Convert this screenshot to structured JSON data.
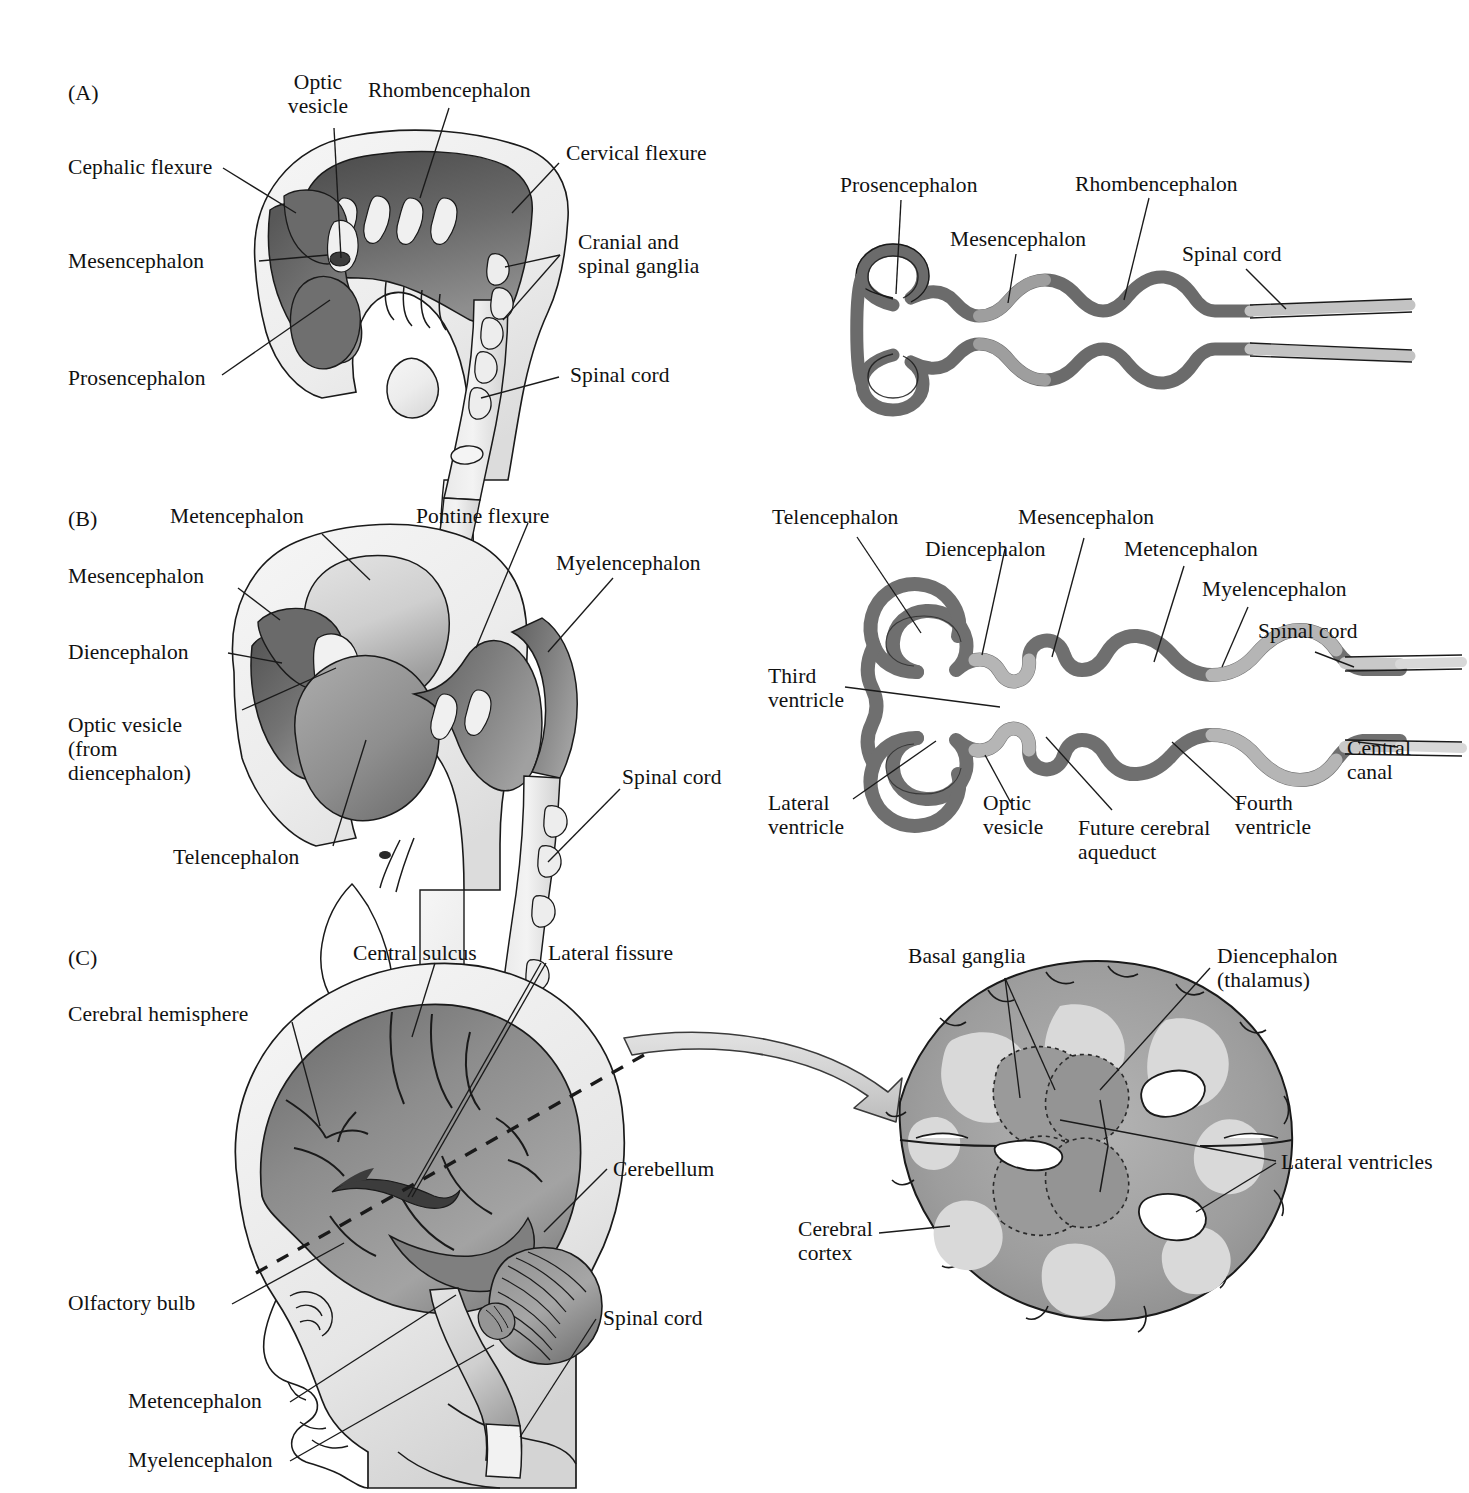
{
  "figure": {
    "panels": [
      "(A)",
      "(B)",
      "(C)"
    ]
  },
  "colors": {
    "ink": "#1a1a1a",
    "tube_dark": "#6f6f6f",
    "tube_light": "#b9b9b9",
    "brain_dark": "#8a8a8a",
    "brain_mid": "#a8a8a8",
    "brain_light": "#d8d8d8",
    "tissue": "#efefef",
    "arrow_fill": "#d6d6d6",
    "white": "#ffffff"
  },
  "panelA": {
    "letter": "(A)",
    "embryo_labels": {
      "optic_vesicle": "Optic\nvesicle",
      "rhombencephalon": "Rhombencephalon",
      "cephalic_flexure": "Cephalic flexure",
      "cervical_flexure": "Cervical flexure",
      "mesencephalon": "Mesencephalon",
      "cranial_spinal_ganglia": "Cranial and\nspinal ganglia",
      "prosencephalon": "Prosencephalon",
      "spinal_cord": "Spinal cord"
    },
    "tube_labels": {
      "prosencephalon": "Prosencephalon",
      "mesencephalon": "Mesencephalon",
      "rhombencephalon": "Rhombencephalon",
      "spinal_cord": "Spinal cord"
    }
  },
  "panelB": {
    "letter": "(B)",
    "embryo_labels": {
      "metencephalon": "Metencephalon",
      "pontine_flexure": "Pontine flexure",
      "mesencephalon": "Mesencephalon",
      "myelencephalon": "Myelencephalon",
      "diencephalon": "Diencephalon",
      "optic_vesicle": "Optic vesicle\n(from\ndiencephalon)",
      "telencephalon": "Telencephalon",
      "spinal_cord": "Spinal cord"
    },
    "tube_labels": {
      "telencephalon": "Telencephalon",
      "diencephalon": "Diencephalon",
      "mesencephalon": "Mesencephalon",
      "metencephalon": "Metencephalon",
      "myelencephalon": "Myelencephalon",
      "spinal_cord": "Spinal cord",
      "third_ventricle": "Third\nventricle",
      "lateral_ventricle": "Lateral\nventricle",
      "optic_vesicle": "Optic\nvesicle",
      "future_cerebral_aqueduct": "Future cerebral\naqueduct",
      "fourth_ventricle": "Fourth\nventricle",
      "central_canal": "Central\ncanal"
    }
  },
  "panelC": {
    "letter": "(C)",
    "head_labels": {
      "central_sulcus": "Central sulcus",
      "lateral_fissure": "Lateral fissure",
      "cerebral_hemisphere": "Cerebral hemisphere",
      "cerebellum": "Cerebellum",
      "olfactory_bulb": "Olfactory bulb",
      "spinal_cord": "Spinal cord",
      "metencephalon": "Metencephalon",
      "myelencephalon": "Myelencephalon"
    },
    "section_labels": {
      "basal_ganglia": "Basal ganglia",
      "diencephalon_thalamus": "Diencephalon\n(thalamus)",
      "lateral_ventricles": "Lateral ventricles",
      "cerebral_cortex": "Cerebral\ncortex"
    }
  }
}
